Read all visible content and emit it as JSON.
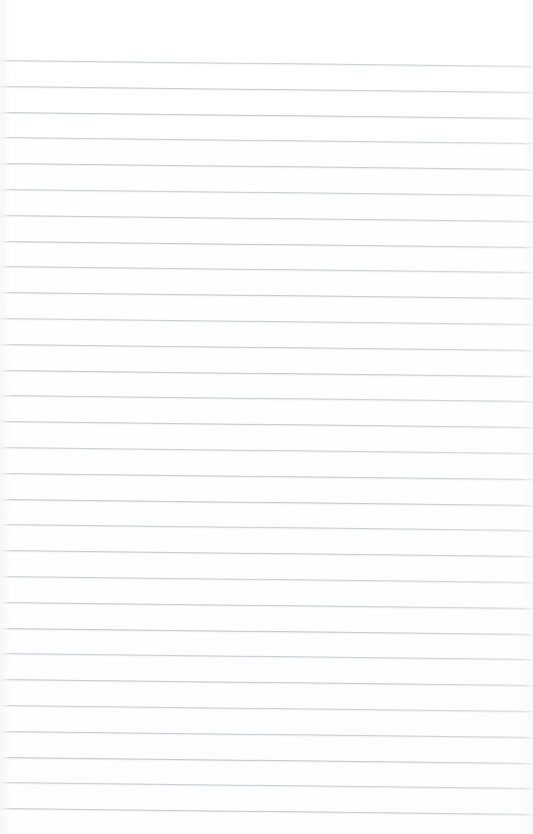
{
  "document": {
    "kind": "lined-paper-scan",
    "title": "",
    "body_text": "",
    "has_handwriting": false,
    "has_printed_text": false,
    "orientation": "portrait"
  },
  "page": {
    "width_px": 533,
    "height_px": 834,
    "background_color": "#fefefe",
    "paper_tone": "#ffffff"
  },
  "ruling": {
    "style": "wide-ruled horizontal lines",
    "line_color": "#c6c9cd",
    "line_blur_color": "#e4e6e9",
    "line_count": 30,
    "line_thickness_px": 1,
    "spacing_px": 25.8,
    "first_line_y_px": 60,
    "last_line_y_px": 808,
    "top_margin_px": 57,
    "bottom_margin_px": 26,
    "left_inset_px": 0,
    "right_inset_px": 0,
    "skew_deg": 0.68,
    "skew_drop_px": 6,
    "has_vertical_margin_rule": false,
    "lines_y": [
      60,
      85.8,
      111.6,
      137.4,
      163.2,
      189,
      214.8,
      240.6,
      266.4,
      292.2,
      318,
      343.8,
      369.6,
      395.4,
      421.2,
      447,
      472.8,
      498.6,
      524.4,
      550.2,
      576,
      601.8,
      627.6,
      653.4,
      679.2,
      705,
      730.8,
      756.6,
      782.4,
      808.2
    ]
  }
}
